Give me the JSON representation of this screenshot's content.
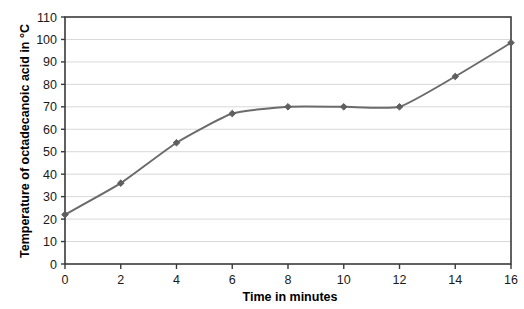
{
  "chart_data": {
    "type": "line",
    "title": "",
    "xlabel": "Time in minutes",
    "ylabel": "Temperature of octadecanoic acid in °C",
    "x": [
      0,
      2,
      4,
      6,
      8,
      10,
      12,
      14,
      16
    ],
    "values": [
      22,
      36,
      54,
      67,
      70,
      70,
      70,
      83.5,
      98.5
    ],
    "series": [
      {
        "name": "Temperature of octadecanoic acid",
        "values": [
          22,
          36,
          54,
          67,
          70,
          70,
          70,
          83.5,
          98.5
        ]
      }
    ],
    "xlim": [
      0,
      16
    ],
    "ylim": [
      0,
      110
    ],
    "xticks": [
      0,
      2,
      4,
      6,
      8,
      10,
      12,
      14,
      16
    ],
    "yticks": [
      0,
      10,
      20,
      30,
      40,
      50,
      60,
      70,
      80,
      90,
      100,
      110
    ],
    "xtick_labels": [
      "0",
      "2",
      "4",
      "6",
      "8",
      "10",
      "12",
      "14",
      "16"
    ],
    "ytick_labels": [
      "0",
      "10",
      "20",
      "30",
      "40",
      "50",
      "60",
      "70",
      "80",
      "90",
      "100",
      "110"
    ],
    "grid": true,
    "grid_axis": "y",
    "legend": false,
    "legend_position": "none",
    "marker": "diamond",
    "line_color": "#6b6b6b",
    "marker_color": "#5f5f5f",
    "grid_color": "#d8d8d8",
    "axis_color": "#3a3a3a",
    "background_color": "#ffffff",
    "annotations": []
  }
}
